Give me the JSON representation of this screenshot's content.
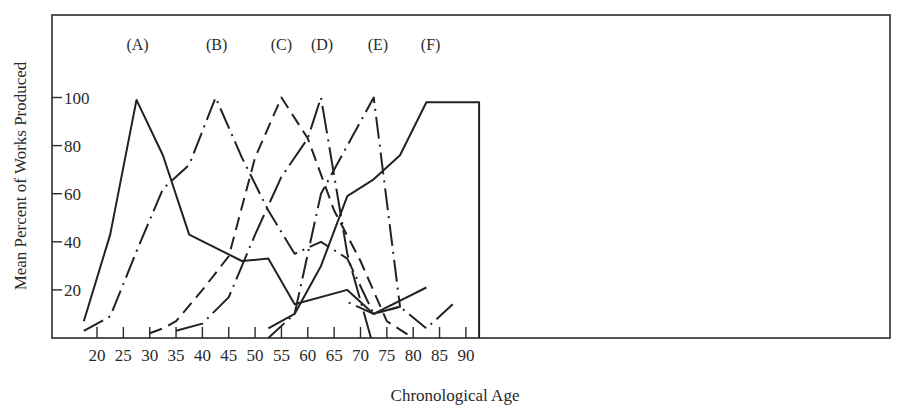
{
  "chart_data": {
    "type": "line",
    "title": "",
    "xlabel": "Chronological Age",
    "ylabel": "Mean Percent of Works Produced",
    "xlim": [
      17,
      94
    ],
    "ylim": [
      0,
      110
    ],
    "x_ticks": [
      20,
      25,
      30,
      35,
      40,
      45,
      50,
      55,
      60,
      65,
      70,
      75,
      80,
      85,
      90
    ],
    "y_ticks": [
      20,
      40,
      60,
      80,
      100
    ],
    "grid": false,
    "legend": "inline labels above each curve peak",
    "series": [
      {
        "name": "(A)",
        "style": "solid",
        "label_x": 27.7,
        "points": [
          [
            17.5,
            7
          ],
          [
            22.5,
            43
          ],
          [
            27.5,
            99
          ],
          [
            32.5,
            76
          ],
          [
            37.5,
            43
          ],
          [
            47.5,
            32
          ],
          [
            52.5,
            33
          ],
          [
            57.5,
            14
          ],
          [
            67.5,
            20
          ],
          [
            72.5,
            10
          ],
          [
            82.5,
            21
          ]
        ]
      },
      {
        "name": "(B)",
        "style": "dash-dot",
        "label_x": 42.7,
        "points": [
          [
            17.5,
            3
          ],
          [
            22.5,
            9
          ],
          [
            27.5,
            36
          ],
          [
            32.5,
            62
          ],
          [
            37.5,
            72
          ],
          [
            42.5,
            100
          ],
          [
            47.5,
            75
          ],
          [
            52.5,
            53
          ],
          [
            57.5,
            35
          ],
          [
            62.5,
            40
          ],
          [
            67.5,
            33
          ],
          [
            72.5,
            10
          ],
          [
            77.5,
            13
          ],
          [
            82.5,
            4
          ],
          [
            87.5,
            14
          ]
        ]
      },
      {
        "name": "(C)",
        "style": "dashed",
        "label_x": 55,
        "points": [
          [
            30,
            2
          ],
          [
            32.5,
            4
          ],
          [
            35,
            7
          ],
          [
            40,
            20
          ],
          [
            45,
            34
          ],
          [
            50,
            75
          ],
          [
            55,
            100
          ],
          [
            60,
            83
          ],
          [
            65,
            53
          ],
          [
            70,
            32
          ],
          [
            75,
            7
          ],
          [
            80,
            0
          ]
        ]
      },
      {
        "name": "(D)",
        "style": "long-dash-dot",
        "label_x": 62.7,
        "points": [
          [
            35,
            3
          ],
          [
            40,
            6
          ],
          [
            45,
            17
          ],
          [
            50,
            43
          ],
          [
            55,
            67
          ],
          [
            60,
            83
          ],
          [
            62.5,
            100
          ],
          [
            67.5,
            35
          ],
          [
            72,
            0
          ]
        ]
      },
      {
        "name": "(E)",
        "style": "dash-dot",
        "label_x": 73.3,
        "points": [
          [
            52.5,
            0
          ],
          [
            57.5,
            10
          ],
          [
            62.5,
            60
          ],
          [
            67.5,
            80
          ],
          [
            72.5,
            100
          ],
          [
            77.5,
            13
          ],
          [
            72.5,
            10
          ],
          [
            67.5,
            15
          ]
        ]
      },
      {
        "name": "(F)",
        "style": "solid",
        "label_x": 83.3,
        "points": [
          [
            52.5,
            4
          ],
          [
            57.5,
            10
          ],
          [
            62.5,
            30
          ],
          [
            67.5,
            59
          ],
          [
            72.5,
            66
          ],
          [
            77.5,
            76
          ],
          [
            82.5,
            98
          ],
          [
            92.5,
            98
          ],
          [
            92.5,
            0
          ]
        ]
      }
    ]
  },
  "axes": {
    "x_title": "Chronological Age",
    "y_title": "Mean Percent of Works Produced"
  }
}
